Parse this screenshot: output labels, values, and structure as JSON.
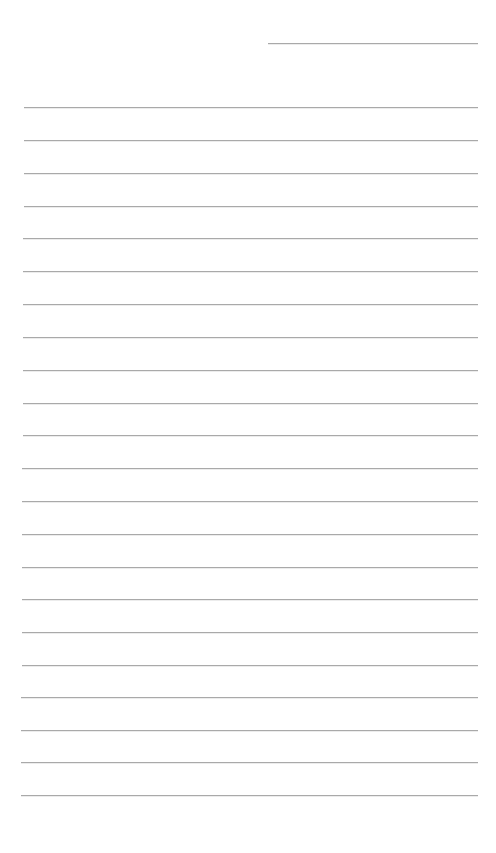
{
  "page": {
    "type": "lined-paper",
    "background_color": "#ffffff",
    "line_color": "#a9a9a9"
  },
  "header_line": {
    "x_start": 268,
    "x_end": 478,
    "y": 43
  },
  "ruled_lines": {
    "count": 22,
    "x_start": 24,
    "x_end": 478,
    "y_positions": [
      107,
      140,
      173,
      206,
      238,
      271,
      304,
      337,
      370,
      403,
      435,
      468,
      501,
      534,
      567,
      599,
      632,
      665,
      697,
      730,
      762,
      795
    ]
  }
}
